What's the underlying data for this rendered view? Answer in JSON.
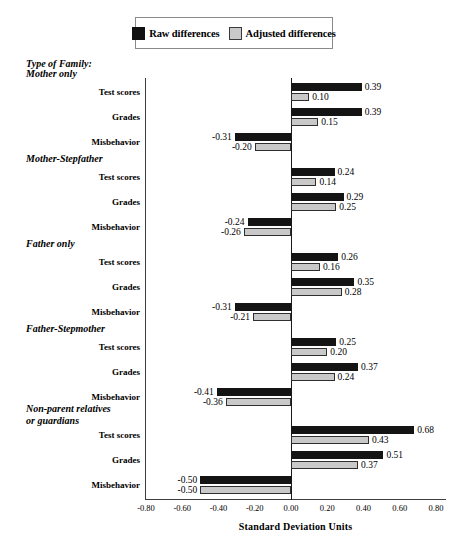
{
  "legend": {
    "entries": [
      {
        "label": "Raw differences",
        "swatch": "black-square-icon",
        "color": "#141414"
      },
      {
        "label": "Adjusted differences",
        "swatch": "gray-square-icon",
        "color": "#c9c9c9"
      }
    ]
  },
  "left_header": "Type of Family:",
  "axis": {
    "title": "Standard Deviation Units",
    "ticks": [
      "-0.80",
      "-0.60",
      "-0.40",
      "-0.20",
      "0.00",
      "0.20",
      "0.40",
      "0.60",
      "0.80"
    ]
  },
  "groups": [
    {
      "title": "Mother only",
      "rows": [
        {
          "label": "Test scores",
          "raw": "0.39",
          "adjusted": "0.10"
        },
        {
          "label": "Grades",
          "raw": "0.39",
          "adjusted": "0.15"
        },
        {
          "label": "Misbehavior",
          "raw": "-0.31",
          "adjusted": "-0.20"
        }
      ]
    },
    {
      "title": "Mother-Stepfather",
      "rows": [
        {
          "label": "Test scores",
          "raw": "0.24",
          "adjusted": "0.14"
        },
        {
          "label": "Grades",
          "raw": "0.29",
          "adjusted": "0.25"
        },
        {
          "label": "Misbehavior",
          "raw": "-0.24",
          "adjusted": "-0.26"
        }
      ]
    },
    {
      "title": "Father only",
      "rows": [
        {
          "label": "Test scores",
          "raw": "0.26",
          "adjusted": "0.16"
        },
        {
          "label": "Grades",
          "raw": "0.35",
          "adjusted": "0.28"
        },
        {
          "label": "Misbehavior",
          "raw": "-0.31",
          "adjusted": "-0.21"
        }
      ]
    },
    {
      "title": "Father-Stepmother",
      "rows": [
        {
          "label": "Test scores",
          "raw": "0.25",
          "adjusted": "0.20"
        },
        {
          "label": "Grades",
          "raw": "0.37",
          "adjusted": "0.24"
        },
        {
          "label": "Misbehavior",
          "raw": "-0.41",
          "adjusted": "-0.36"
        }
      ]
    },
    {
      "title": "Non-parent relatives\nor guardians",
      "rows": [
        {
          "label": "Test scores",
          "raw": "0.68",
          "adjusted": "0.43"
        },
        {
          "label": "Grades",
          "raw": "0.51",
          "adjusted": "0.37"
        },
        {
          "label": "Misbehavior",
          "raw": "-0.50",
          "adjusted": "-0.50"
        }
      ]
    }
  ],
  "chart_data": {
    "type": "bar",
    "title": "",
    "xlabel": "Standard Deviation Units",
    "ylabel": "Type of Family:",
    "orientation": "horizontal",
    "xlim": [
      -0.8,
      0.8
    ],
    "xticks": [
      -0.8,
      -0.6,
      -0.4,
      -0.2,
      0.0,
      0.2,
      0.4,
      0.6,
      0.8
    ],
    "grid": false,
    "legend_position": "top-center",
    "series": [
      {
        "name": "Raw differences",
        "color": "#141414",
        "values": [
          0.39,
          0.39,
          -0.31,
          0.24,
          0.29,
          -0.24,
          0.26,
          0.35,
          -0.31,
          0.25,
          0.37,
          -0.41,
          0.68,
          0.51,
          -0.5
        ]
      },
      {
        "name": "Adjusted differences",
        "color": "#c9c9c9",
        "values": [
          0.1,
          0.15,
          -0.2,
          0.14,
          0.25,
          -0.26,
          0.16,
          0.28,
          -0.21,
          0.2,
          0.24,
          -0.36,
          0.43,
          0.37,
          -0.5
        ]
      }
    ],
    "categories": [
      "Mother only - Test scores",
      "Mother only - Grades",
      "Mother only - Misbehavior",
      "Mother-Stepfather - Test scores",
      "Mother-Stepfather - Grades",
      "Mother-Stepfather - Misbehavior",
      "Father only - Test scores",
      "Father only - Grades",
      "Father only - Misbehavior",
      "Father-Stepmother - Test scores",
      "Father-Stepmother - Grades",
      "Father-Stepmother - Misbehavior",
      "Non-parent relatives or guardians - Test scores",
      "Non-parent relatives or guardians - Grades",
      "Non-parent relatives or guardians - Misbehavior"
    ]
  }
}
